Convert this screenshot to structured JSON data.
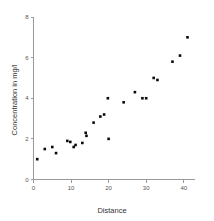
{
  "chart_data": {
    "type": "scatter",
    "title": "",
    "xlabel": "Distance",
    "ylabel": "Concentration in mg/l",
    "xlim": [
      0,
      43
    ],
    "ylim": [
      0,
      8
    ],
    "xticks": [
      0,
      10,
      20,
      30,
      40
    ],
    "yticks": [
      0,
      2,
      4,
      6,
      8
    ],
    "xtick_labels": [
      "0",
      "10",
      "20",
      "30",
      "40"
    ],
    "ytick_labels": [
      "0",
      "2",
      "4",
      "6",
      "8"
    ],
    "grid": false,
    "legend": null,
    "marker": "square",
    "marker_color": "#0a0a0a",
    "points": [
      {
        "x": 1.0,
        "y": 1.0
      },
      {
        "x": 3.0,
        "y": 1.5
      },
      {
        "x": 5.0,
        "y": 1.6
      },
      {
        "x": 6.0,
        "y": 1.3
      },
      {
        "x": 9.0,
        "y": 1.9
      },
      {
        "x": 9.8,
        "y": 1.85
      },
      {
        "x": 10.7,
        "y": 1.6
      },
      {
        "x": 11.2,
        "y": 1.7
      },
      {
        "x": 13.0,
        "y": 1.8
      },
      {
        "x": 13.9,
        "y": 2.3
      },
      {
        "x": 14.1,
        "y": 2.15
      },
      {
        "x": 16.0,
        "y": 2.8
      },
      {
        "x": 17.8,
        "y": 3.1
      },
      {
        "x": 18.8,
        "y": 3.2
      },
      {
        "x": 19.8,
        "y": 4.0
      },
      {
        "x": 20.0,
        "y": 2.0
      },
      {
        "x": 24.0,
        "y": 3.8
      },
      {
        "x": 27.0,
        "y": 4.3
      },
      {
        "x": 29.0,
        "y": 4.0
      },
      {
        "x": 30.0,
        "y": 4.0
      },
      {
        "x": 32.0,
        "y": 5.0
      },
      {
        "x": 33.0,
        "y": 4.9
      },
      {
        "x": 37.0,
        "y": 5.8
      },
      {
        "x": 39.0,
        "y": 6.1
      },
      {
        "x": 41.0,
        "y": 7.0
      }
    ]
  }
}
